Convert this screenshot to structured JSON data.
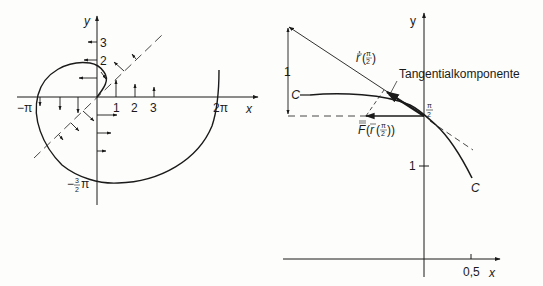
{
  "left_diagram": {
    "axis_x_label": "x",
    "axis_y_label": "y",
    "x_ticks": [
      "1",
      "2",
      "3"
    ],
    "y_ticks": [
      "2",
      "3"
    ],
    "label_neg_pi": "−π",
    "label_2pi": "2π",
    "label_neg_three_half_pi_num": "3",
    "label_neg_three_half_pi_den": "2",
    "label_neg_sign": "−",
    "label_pi": "π"
  },
  "right_diagram": {
    "axis_x_label": "x",
    "axis_y_label": "y",
    "x_tick": "0,5",
    "y_tick": "1",
    "left_scale_label": "1",
    "curve_label": "C",
    "curve_label_end": "C",
    "tangent_label": "Tangentialkomponente",
    "point_label_num": "π",
    "point_label_den": "2",
    "velocity_label_main": "ṙ",
    "velocity_label_arg": "π/2",
    "force_label": "F⃗(r⃗(π/2))",
    "force_label_F": "F",
    "force_label_r": "r"
  },
  "colors": {
    "ink": "#1a1a1a",
    "paper": "#fdfdfb"
  }
}
